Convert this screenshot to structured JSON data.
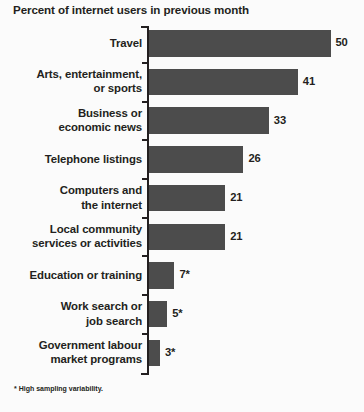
{
  "chart_data": {
    "type": "bar",
    "orientation": "horizontal",
    "title": "Percent of internet users in previous month",
    "xlabel": "",
    "ylabel": "",
    "xlim": [
      0,
      50
    ],
    "grid": false,
    "legend": null,
    "footnote": "* High sampling variability.",
    "bar_color": "#4c4c4c",
    "background_color": "#fbfbfb",
    "text_color": "#231f20",
    "categories": [
      "Travel",
      "Arts, entertainment,\nor sports",
      "Business or\neconomic news",
      "Telephone listings",
      "Computers and\nthe internet",
      "Local community\nservices or activities",
      "Education or training",
      "Work search or\njob search",
      "Government labour\nmarket programs"
    ],
    "values": [
      50,
      41,
      33,
      26,
      21,
      21,
      7,
      5,
      3
    ],
    "value_labels": [
      "50",
      "41",
      "33",
      "26",
      "21",
      "21",
      "7*",
      "5*",
      "3*"
    ],
    "high_sampling_variability": [
      false,
      false,
      false,
      false,
      false,
      false,
      true,
      true,
      true
    ]
  }
}
